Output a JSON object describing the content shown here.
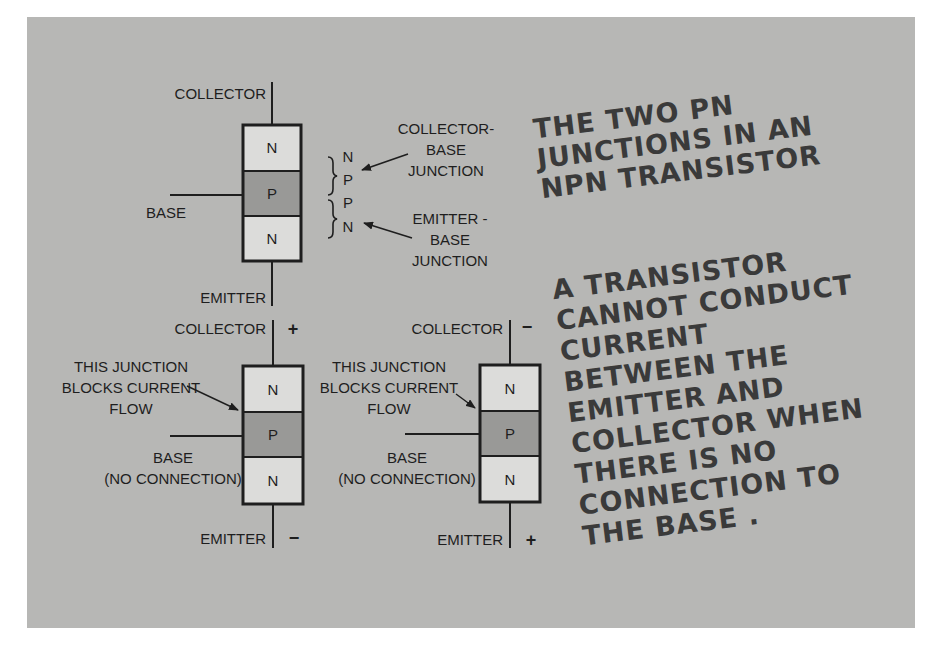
{
  "colors": {
    "background": "#b7b7b5",
    "n_region": "#dcdcda",
    "p_region": "#999997",
    "outline": "#1e1e1e",
    "handwriting": "#3a3a3a"
  },
  "top_diagram": {
    "collector_label": "COLLECTOR",
    "base_label": "BASE",
    "emitter_label": "EMITTER",
    "regions": [
      "N",
      "P",
      "N"
    ],
    "pairs": {
      "upper": [
        "N",
        "P"
      ],
      "lower": [
        "P",
        "N"
      ]
    },
    "collector_base_junction": [
      "COLLECTOR-",
      "BASE",
      "JUNCTION"
    ],
    "emitter_base_junction": [
      "EMITTER -",
      "BASE",
      "JUNCTION"
    ],
    "caption": [
      "THE TWO PN",
      "JUNCTIONS IN AN",
      "NPN TRANSISTOR"
    ]
  },
  "bottom_left_diagram": {
    "collector_label": "COLLECTOR",
    "collector_polarity": "+",
    "emitter_label": "EMITTER",
    "emitter_polarity": "−",
    "regions": [
      "N",
      "P",
      "N"
    ],
    "junction_note": [
      "THIS JUNCTION",
      "BLOCKS CURRENT",
      "FLOW"
    ],
    "base_note": [
      "BASE",
      "(NO CONNECTION)"
    ]
  },
  "bottom_right_diagram": {
    "collector_label": "COLLECTOR",
    "collector_polarity": "−",
    "emitter_label": "EMITTER",
    "emitter_polarity": "+",
    "regions": [
      "N",
      "P",
      "N"
    ],
    "junction_note": [
      "THIS JUNCTION",
      "BLOCKS CURRENT",
      "FLOW"
    ],
    "base_note": [
      "BASE",
      "(NO CONNECTION)"
    ]
  },
  "explanation": [
    "A TRANSISTOR",
    "CANNOT CONDUCT",
    "CURRENT",
    "BETWEEN THE",
    "EMITTER AND",
    "COLLECTOR WHEN",
    "THERE IS NO",
    "CONNECTION TO",
    "THE BASE ."
  ]
}
